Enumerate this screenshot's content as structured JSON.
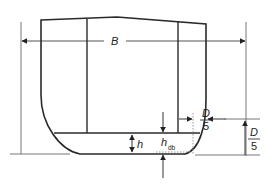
{
  "diagram": {
    "title": "",
    "labels": {
      "breadth": "B",
      "inner_bottom_height": "h",
      "double_bottom_height_main": "h",
      "double_bottom_height_sub": "db",
      "side_tank_fraction_num": "D",
      "side_tank_fraction_den": "5",
      "bilge_height_fraction_num": "D",
      "bilge_height_fraction_den": "5"
    },
    "colors": {
      "hull_stroke": "#2a2a2a",
      "dimension_stroke": "#555555",
      "dotted_stroke": "#999999",
      "background": "#ffffff"
    }
  }
}
